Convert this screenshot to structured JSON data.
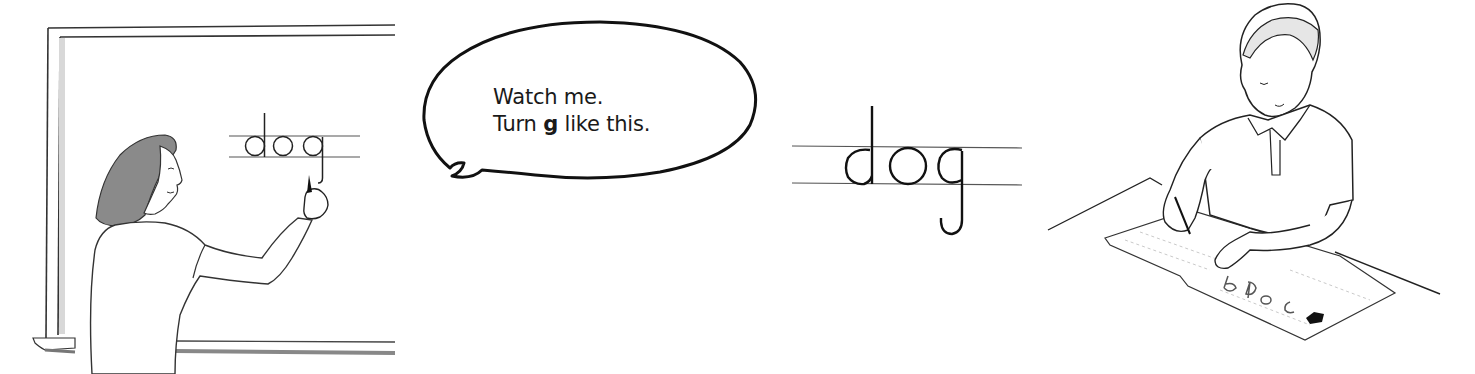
{
  "figure": {
    "panels": [
      {
        "id": "teacher",
        "description": "Teacher writing on chalkboard"
      },
      {
        "id": "speech",
        "description": "Speech bubble"
      },
      {
        "id": "model-word",
        "description": "Model handwritten word on guide lines"
      },
      {
        "id": "student",
        "description": "Student practicing on worksheet"
      }
    ]
  },
  "chalkboard": {
    "word": "dog"
  },
  "speech_bubble": {
    "line1": "Watch me.",
    "line2_prefix": "Turn ",
    "line2_bold": "g",
    "line2_suffix": " like this."
  },
  "model_word": {
    "word": "dog"
  },
  "worksheet": {
    "letters": [
      "b",
      "d",
      "a",
      "c"
    ]
  },
  "colors": {
    "ink": "#1a1a1a",
    "guide_line": "#555555",
    "shading": "#9a9a9a",
    "background": "#ffffff"
  }
}
